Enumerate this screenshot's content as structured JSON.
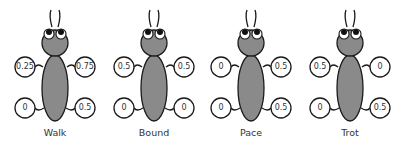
{
  "colors": {
    "body_fill": "#8a8a8a",
    "outline": "#1a1a1a",
    "circle_fill": "#ffffff",
    "text": "#333333"
  },
  "gaits": [
    {
      "name": "Walk",
      "center_x": 55,
      "legs": {
        "front_left": "0.25",
        "front_right": "0.75",
        "rear_left": "0",
        "rear_right": "0.5"
      }
    },
    {
      "name": "Bound",
      "center_x": 154,
      "legs": {
        "front_left": "0.5",
        "front_right": "0.5",
        "rear_left": "0",
        "rear_right": "0"
      }
    },
    {
      "name": "Pace",
      "center_x": 251,
      "legs": {
        "front_left": "0",
        "front_right": "0.5",
        "rear_left": "0",
        "rear_right": "0.5"
      }
    },
    {
      "name": "Trot",
      "center_x": 350,
      "legs": {
        "front_left": "0.5",
        "front_right": "0",
        "rear_left": "0",
        "rear_right": "0.5"
      }
    }
  ]
}
